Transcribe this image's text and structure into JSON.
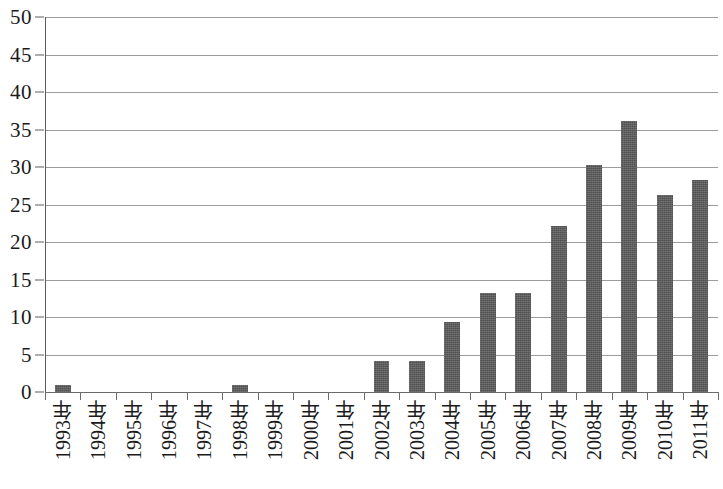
{
  "chart_data": {
    "type": "bar",
    "title": "",
    "subtitle": "",
    "xlabel": "",
    "ylabel": "",
    "ylim": [
      0,
      50
    ],
    "ytick_step": 5,
    "yticks": [
      0,
      5,
      10,
      15,
      20,
      25,
      30,
      35,
      40,
      45,
      50
    ],
    "ytick_labels": [
      "0",
      "5",
      "10",
      "15",
      "20",
      "25",
      "30",
      "35",
      "40",
      "45",
      "50"
    ],
    "grid": true,
    "grid_axis": "y",
    "legend": false,
    "legend_position": "none",
    "bar_color": "#575757",
    "gridline_color": "#9c9c9c",
    "axis_color": "#5a5a5a",
    "background_color": "#ffffff",
    "categories": [
      "1993年",
      "1994年",
      "1995年",
      "1996年",
      "1997年",
      "1998年",
      "1999年",
      "2000年",
      "2001年",
      "2002年",
      "2003年",
      "2004年",
      "2005年",
      "2006年",
      "2007年",
      "2008年",
      "2009年",
      "2010年",
      "2011年"
    ],
    "values": [
      1.0,
      0,
      0,
      0,
      0,
      1.0,
      0,
      0,
      0,
      4.2,
      4.2,
      9.3,
      13.2,
      13.2,
      22.2,
      30.3,
      36.2,
      26.3,
      28.3
    ],
    "annotations": []
  }
}
